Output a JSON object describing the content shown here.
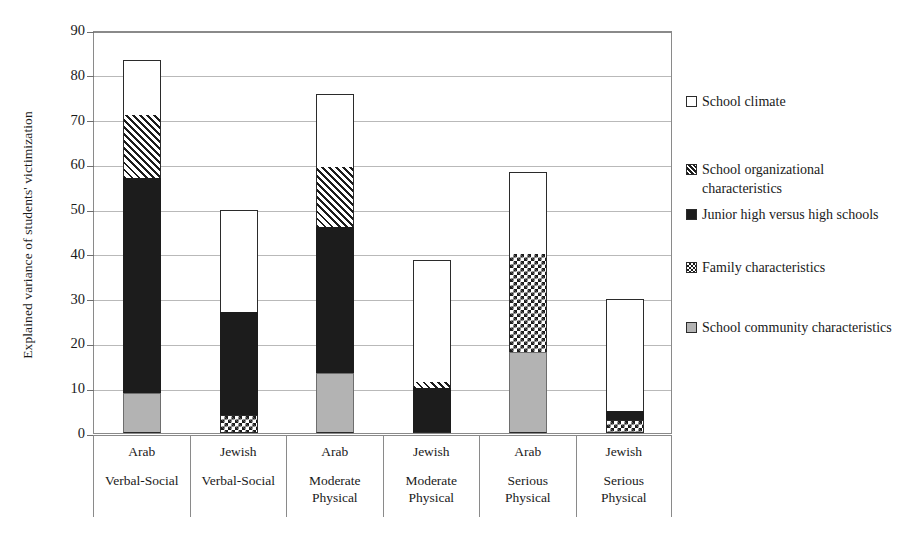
{
  "chart_data": {
    "type": "bar",
    "subtype": "stacked-bar",
    "title": "",
    "xlabel": "",
    "ylabel": "Explained variance of students' victimization",
    "ylim": [
      0,
      90
    ],
    "ytick_step": 10,
    "yticks": [
      "90",
      "80",
      "70",
      "60",
      "50",
      "40",
      "30",
      "20",
      "10",
      "0"
    ],
    "grid": true,
    "legend_position": "right",
    "categories": [
      {
        "line1": "Arab",
        "line2": "Verbal-Social"
      },
      {
        "line1": "Jewish",
        "line2": "Verbal-Social"
      },
      {
        "line1": "Arab",
        "line2": "Moderate\nPhysical"
      },
      {
        "line1": "Jewish",
        "line2": "Moderate\nPhysical"
      },
      {
        "line1": "Arab",
        "line2": "Serious\nPhysical"
      },
      {
        "line1": "Jewish",
        "line2": "Serious\nPhysical"
      }
    ],
    "category_labels": [
      "Arab Verbal-Social",
      "Jewish Verbal-Social",
      "Arab Moderate Physical",
      "Jewish Moderate Physical",
      "Arab Serious Physical",
      "Jewish Serious Physical"
    ],
    "series": [
      {
        "name": "School community characteristics",
        "pattern": "gray",
        "values": [
          9,
          0,
          13.5,
          0,
          18,
          0
        ]
      },
      {
        "name": "Family characteristics",
        "pattern": "check",
        "values": [
          0,
          4,
          0,
          0,
          22,
          3
        ]
      },
      {
        "name": "Junior high versus high schools",
        "pattern": "black",
        "values": [
          48,
          23,
          32.5,
          10,
          0,
          2
        ]
      },
      {
        "name": "School organizational characteristics",
        "pattern": "hatch",
        "values": [
          14,
          0,
          13.5,
          1.5,
          0,
          0
        ]
      },
      {
        "name": "School climate",
        "pattern": "white",
        "values": [
          12,
          22.5,
          16,
          27,
          18,
          24.8
        ]
      }
    ],
    "totals": [
      83,
      49.5,
      75.5,
      38.5,
      58,
      29.8
    ],
    "stack_order_bottom_to_top": [
      "School community characteristics",
      "Family characteristics",
      "Junior high versus high schools",
      "School organizational characteristics",
      "School climate"
    ]
  },
  "legend": {
    "items": [
      {
        "label": "School climate",
        "pattern": "white"
      },
      {
        "label": "School organizational characteristics",
        "pattern": "hatch"
      },
      {
        "label": "Junior high versus high schools",
        "pattern": "black"
      },
      {
        "label": "Family characteristics",
        "pattern": "check"
      },
      {
        "label": "School community characteristics",
        "pattern": "gray"
      }
    ]
  },
  "colors": {
    "white_fill": "#ffffff",
    "black_fill": "#1c1c1c",
    "gray_fill": "#b3b3b3",
    "outline": "#2b2b2b",
    "gridline": "#b9b9b9",
    "axis": "#8a8a8a"
  }
}
